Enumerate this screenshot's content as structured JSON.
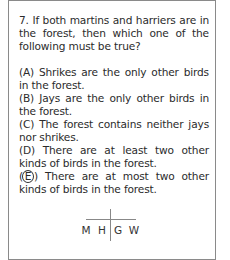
{
  "question": {
    "number": "7.",
    "stem": "7. If both martins and harriers are in the forest, then which one of the following must be true?",
    "choices": [
      {
        "label": "(A)",
        "text": "(A) Shrikes are the only other birds in the forest."
      },
      {
        "label": "(B)",
        "text": "(B) Jays are the only other birds in the forest."
      },
      {
        "label": "(C)",
        "text": "(C) The forest contains neither jays nor shrikes."
      },
      {
        "label": "(D)",
        "text": "(D) There are at least two other kinds of birds in the forest."
      },
      {
        "label": "E",
        "text": " There are at most two other kinds of birds in the forest.",
        "circled": true
      }
    ]
  },
  "diagram": {
    "letters": [
      "M",
      "H",
      "G",
      "W"
    ]
  }
}
